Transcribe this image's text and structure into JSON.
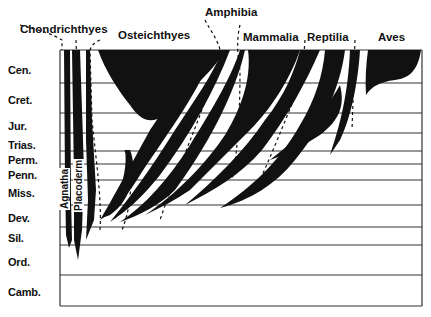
{
  "diagram": {
    "type": "phylogenetic spindle diagram (vertebrate evolution through geologic time)",
    "periods": [
      {
        "label": "Cen.",
        "y": 70
      },
      {
        "label": "Cret.",
        "y": 100
      },
      {
        "label": "Jur.",
        "y": 126
      },
      {
        "label": "Trias.",
        "y": 145
      },
      {
        "label": "Perm.",
        "y": 160
      },
      {
        "label": "Penn.",
        "y": 175
      },
      {
        "label": "Miss.",
        "y": 193
      },
      {
        "label": "Dev.",
        "y": 218
      },
      {
        "label": "Sil.",
        "y": 238
      },
      {
        "label": "Ord.",
        "y": 262
      },
      {
        "label": "Camb.",
        "y": 292
      }
    ],
    "clades": [
      {
        "label": "Chondrichthyes"
      },
      {
        "label": "Osteichthyes"
      },
      {
        "label": "Amphibia"
      },
      {
        "label": "Mammalia"
      },
      {
        "label": "Reptilia"
      },
      {
        "label": "Aves"
      }
    ],
    "vertical_labels": [
      {
        "label": "Agnatha"
      },
      {
        "label": "Placoderm"
      }
    ],
    "colors": {
      "ink": "#111111",
      "background": "#ffffff",
      "grid": "#333333"
    }
  }
}
